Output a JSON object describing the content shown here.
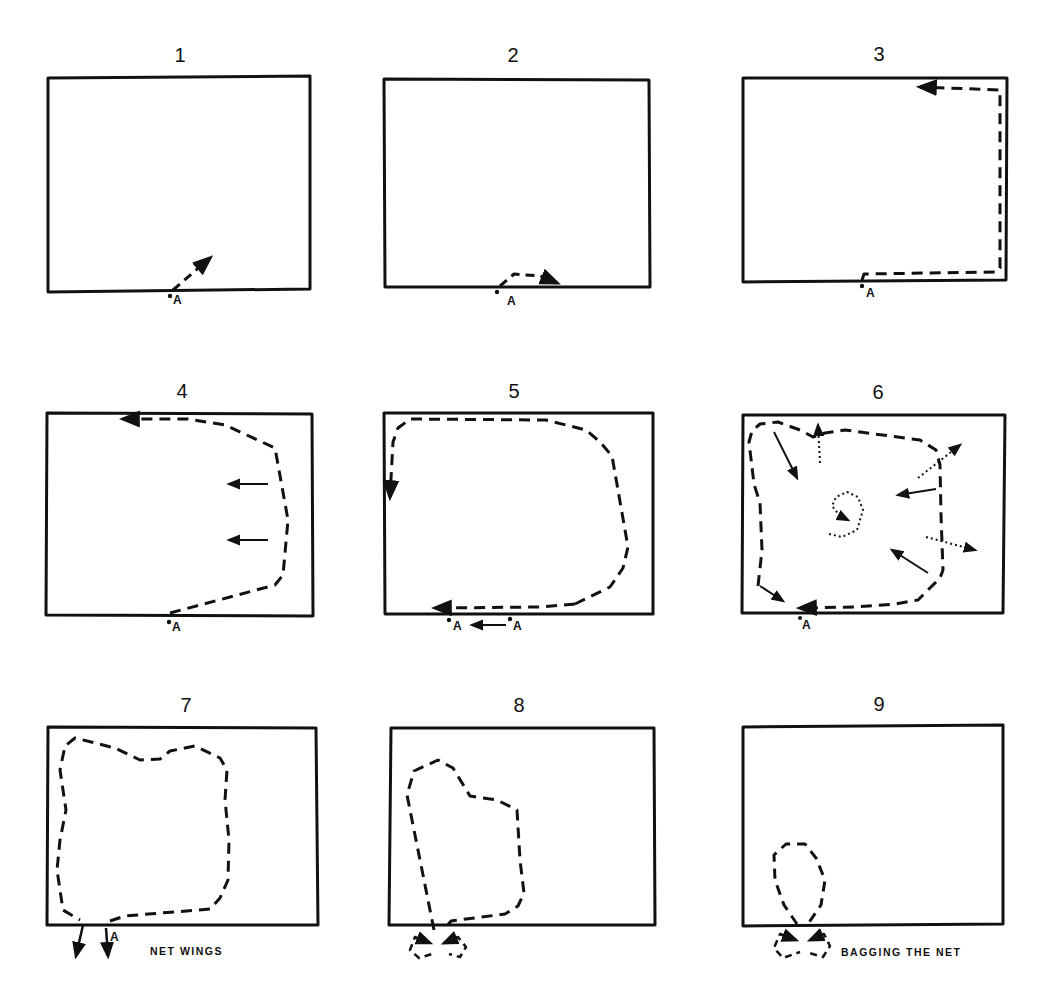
{
  "figure": {
    "stroke_color": "#111111",
    "background_color": "#ffffff"
  },
  "panels": [
    {
      "number": "1",
      "label_point": "A",
      "caption": ""
    },
    {
      "number": "2",
      "label_point": "A",
      "caption": ""
    },
    {
      "number": "3",
      "label_point": "A",
      "caption": ""
    },
    {
      "number": "4",
      "label_point": "A",
      "caption": ""
    },
    {
      "number": "5",
      "label_point": "A",
      "label_point_2": "A",
      "caption": ""
    },
    {
      "number": "6",
      "label_point": "A",
      "caption": ""
    },
    {
      "number": "7",
      "label_point": "A",
      "caption": "NET WINGS"
    },
    {
      "number": "8",
      "caption": ""
    },
    {
      "number": "9",
      "caption": "BAGGING THE NET"
    }
  ],
  "legend": {
    "dashed_line": "net path",
    "solid_arrow": "direction of movement",
    "dotted_arrow": "escape / fish movement"
  }
}
